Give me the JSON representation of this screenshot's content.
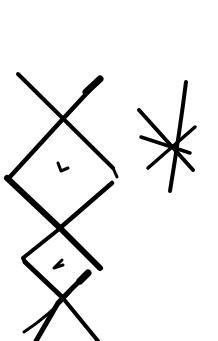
{
  "image": {
    "description": "Hand-drawn black ink sketch on white: a vertical chain of two diamonds bounded by X strokes, with a small tick mark inside each diamond, and an asterisk/star glyph to the right",
    "background": "#ffffff",
    "ink": "#000000"
  },
  "figures": [
    {
      "name": "diamond-chain",
      "parts": [
        "upper-x",
        "upper-diamond",
        "upper-tick",
        "lower-diamond",
        "lower-tick",
        "lower-x"
      ]
    },
    {
      "name": "asterisk-star",
      "parts": [
        "vertical-stroke",
        "diagonal-stroke",
        "horizontal-stroke",
        "cross-stroke"
      ]
    }
  ]
}
